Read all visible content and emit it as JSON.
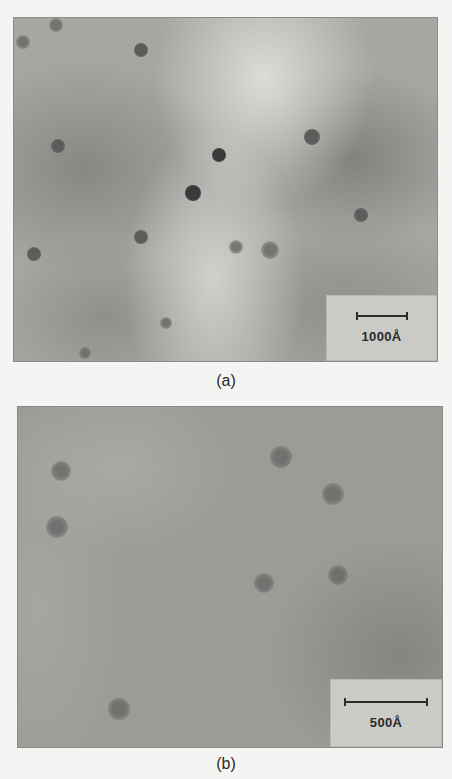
{
  "figure": {
    "panels": [
      {
        "id": "a",
        "caption": "(a)",
        "scale_bar_label": "1000Å",
        "particles": [
          {
            "x": 42,
            "y": 7,
            "r": 7,
            "tone": "faint"
          },
          {
            "x": 9,
            "y": 24,
            "r": 7,
            "tone": "faint"
          },
          {
            "x": 127,
            "y": 32,
            "r": 7,
            "tone": "mid"
          },
          {
            "x": 44,
            "y": 128,
            "r": 7,
            "tone": "mid"
          },
          {
            "x": 205,
            "y": 137,
            "r": 7,
            "tone": "dark"
          },
          {
            "x": 179,
            "y": 175,
            "r": 8,
            "tone": "dark"
          },
          {
            "x": 298,
            "y": 119,
            "r": 8,
            "tone": "mid"
          },
          {
            "x": 347,
            "y": 197,
            "r": 7,
            "tone": "mid"
          },
          {
            "x": 127,
            "y": 219,
            "r": 7,
            "tone": "mid"
          },
          {
            "x": 20,
            "y": 236,
            "r": 7,
            "tone": "mid"
          },
          {
            "x": 222,
            "y": 229,
            "r": 7,
            "tone": "faint"
          },
          {
            "x": 256,
            "y": 232,
            "r": 9,
            "tone": "faint"
          },
          {
            "x": 152,
            "y": 305,
            "r": 6,
            "tone": "faint"
          },
          {
            "x": 71,
            "y": 335,
            "r": 6,
            "tone": "faint"
          }
        ]
      },
      {
        "id": "b",
        "caption": "(b)",
        "scale_bar_label": "500Å",
        "particles": [
          {
            "x": 43,
            "y": 64,
            "r": 10,
            "tone": "faint"
          },
          {
            "x": 39,
            "y": 120,
            "r": 11,
            "tone": "faint"
          },
          {
            "x": 263,
            "y": 50,
            "r": 11,
            "tone": "faint"
          },
          {
            "x": 315,
            "y": 87,
            "r": 11,
            "tone": "faint"
          },
          {
            "x": 246,
            "y": 176,
            "r": 10,
            "tone": "faint"
          },
          {
            "x": 320,
            "y": 168,
            "r": 10,
            "tone": "faint"
          },
          {
            "x": 101,
            "y": 302,
            "r": 11,
            "tone": "faint"
          }
        ]
      }
    ]
  }
}
